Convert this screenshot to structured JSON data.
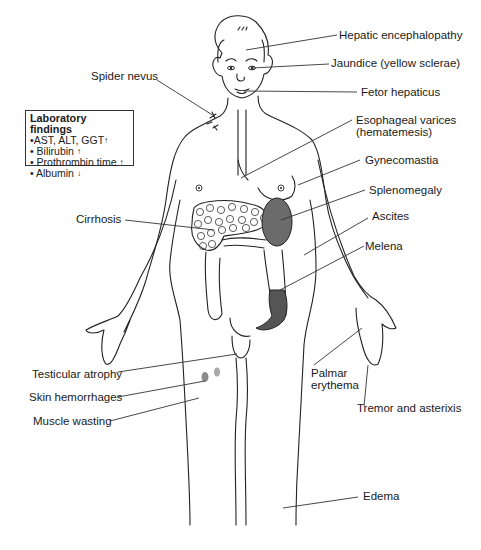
{
  "labels": {
    "hepatic_encephalopathy": "Hepatic encephalopathy",
    "jaundice": "Jaundice (yellow sclerae)",
    "fetor_hepaticus": "Fetor hepaticus",
    "spider_nevus": "Spider nevus",
    "esophageal_varices_line1": "Esophageal varices",
    "esophageal_varices_line2": "(hematemesis)",
    "gynecomastia": "Gynecomastia",
    "splenomegaly": "Splenomegaly",
    "cirrhosis": "Cirrhosis",
    "ascites": "Ascites",
    "melena": "Melena",
    "testicular_atrophy": "Testicular atrophy",
    "skin_hemorrhages": "Skin hemorrhages",
    "muscle_wasting": "Muscle wasting",
    "palmar_erythema_line1": "Palmar",
    "palmar_erythema_line2": "erythema",
    "tremor_asterixis": "Tremor and asterixis",
    "edema": "Edema"
  },
  "lab_findings": {
    "title": "Laboratory findings",
    "items": [
      {
        "bullet": "•",
        "text": "AST, ALT, GGT",
        "direction": "↑"
      },
      {
        "bullet": "• ",
        "text": "Bilirubin ",
        "direction": "↑"
      },
      {
        "bullet": "• ",
        "text": "Prothrombin time ",
        "direction": "↑"
      },
      {
        "bullet": "• ",
        "text": "Albumin ",
        "direction": "↓"
      }
    ]
  },
  "colors": {
    "outline": "#222222",
    "spleen_fill": "#6b6b6b",
    "melena_fill": "#555555",
    "hemorrhage_fill": "#8a8a8a"
  }
}
